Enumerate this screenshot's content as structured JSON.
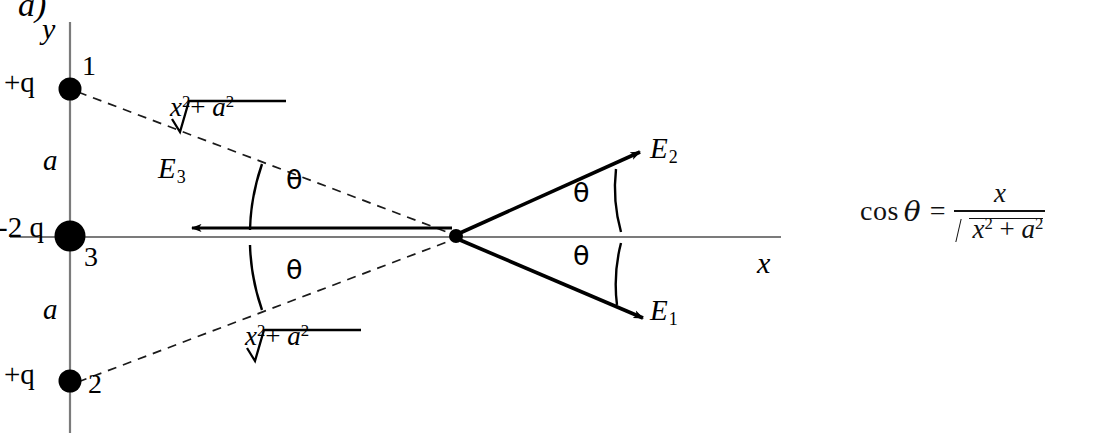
{
  "figure": {
    "panel_letter": "a)",
    "axes": {
      "y_label": "y",
      "x_label": "x"
    },
    "charges": [
      {
        "index": "1",
        "value": "+q",
        "position": "top",
        "sign": "positive"
      },
      {
        "index": "3",
        "value": "-2 q",
        "position": "origin",
        "sign": "negative"
      },
      {
        "index": "2",
        "value": "+q",
        "position": "bottom",
        "sign": "positive"
      }
    ],
    "separations": [
      {
        "label": "a",
        "between": "charge1-charge3"
      },
      {
        "label": "a",
        "between": "charge3-charge2"
      }
    ],
    "distance_labels": [
      {
        "radicand_x": "x",
        "radicand_x_exp": "2",
        "plus": "+",
        "radicand_a": "a",
        "radicand_a_exp": "2",
        "from": "charge1"
      },
      {
        "radicand_x": "x",
        "radicand_x_exp": "2",
        "plus": "+",
        "radicand_a": "a",
        "radicand_a_exp": "2",
        "from": "charge2"
      }
    ],
    "field_vectors": [
      {
        "symbol": "E",
        "subscript": "1",
        "direction": "down-right",
        "source": "charge1"
      },
      {
        "symbol": "E",
        "subscript": "2",
        "direction": "up-right",
        "source": "charge2"
      },
      {
        "symbol": "E",
        "subscript": "3",
        "direction": "left",
        "source": "charge3"
      }
    ],
    "angles": [
      {
        "label": "θ",
        "location": "upper-left"
      },
      {
        "label": "θ",
        "location": "lower-left"
      },
      {
        "label": "θ",
        "location": "upper-right"
      },
      {
        "label": "θ",
        "location": "lower-right"
      }
    ],
    "equation": {
      "function": "cos",
      "angle": "θ",
      "equals": "=",
      "numerator": "x",
      "denominator_x": "x",
      "denominator_x_exp": "2",
      "denominator_plus": "+",
      "denominator_a": "a",
      "denominator_a_exp": "2"
    },
    "colors": {
      "ink": "#000000",
      "axis": "#7a7a7a",
      "background": "#ffffff"
    }
  }
}
